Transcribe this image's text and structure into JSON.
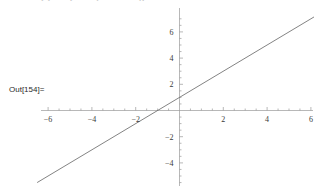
{
  "notebook": {
    "out_label": "Out[154]=",
    "cut_input_fragment": "ClearAll[x]; Plot[x + 1, {x, -6.5, 6.5}]"
  },
  "colors": {
    "background": "#ffffff",
    "axis": "#9a9a9a",
    "curve": "#6d6d6d",
    "tick_label": "#3a3a3a",
    "out_label": "#2a2a2a"
  },
  "chart_data": {
    "type": "line",
    "title": "",
    "xlabel": "",
    "ylabel": "",
    "xlim": [
      -6.6,
      6.6
    ],
    "ylim": [
      -5.6,
      7.2
    ],
    "grid": false,
    "legend": null,
    "axes_style": "centered-cross",
    "x_ticks_major": [
      -6,
      -4,
      -2,
      2,
      4,
      6
    ],
    "x_tick_labels": [
      "-6",
      "-4",
      "-2",
      "2",
      "4",
      "6"
    ],
    "y_ticks_major": [
      -4,
      -2,
      2,
      4,
      6
    ],
    "y_tick_labels": [
      "-4",
      "-2",
      "2",
      "4",
      "6"
    ],
    "x_minor_step": 0.5,
    "y_minor_step": 0.5,
    "series": [
      {
        "name": "x + 1",
        "equation": "y = x + 1",
        "slope": 1,
        "intercept": 1,
        "x": [
          -6.5,
          6.5
        ],
        "values": [
          -5.5,
          7.5
        ],
        "color": "#6d6d6d"
      }
    ],
    "annotations": []
  }
}
